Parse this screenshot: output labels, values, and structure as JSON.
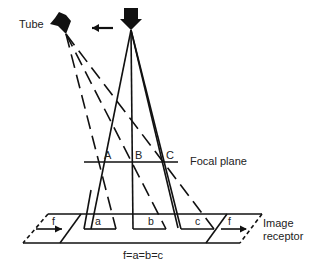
{
  "labels": {
    "tube": "Tube",
    "focal_plane": "Focal plane",
    "point_a": "A",
    "point_b": "B",
    "point_c": "C",
    "image_a": "a",
    "image_b": "b",
    "image_c": "c",
    "f_left": "f",
    "f_right": "f",
    "image_receptor_line1": "Image",
    "image_receptor_line2": "receptor",
    "equation": "f=a=b=c"
  },
  "icons": {
    "tube_left": "x-ray-tube-tilted-icon",
    "tube_right": "x-ray-tube-icon",
    "motion_arrow": "arrow-left-icon"
  },
  "colors": {
    "line": "#111111",
    "background": "#ffffff"
  }
}
